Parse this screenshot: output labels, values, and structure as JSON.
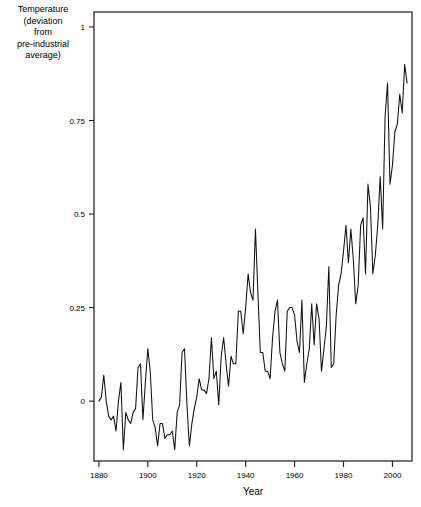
{
  "chart_data": {
    "type": "line",
    "title": "",
    "xlabel": "Year",
    "ylabel": "Temperature (deviation from pre-industrial average)",
    "ylabel_lines": [
      "Temperature",
      "(deviation",
      "from",
      "pre-industrial",
      "average)"
    ],
    "xlim": [
      1878,
      2008
    ],
    "ylim": [
      -0.16,
      1.04
    ],
    "grid": false,
    "legend": null,
    "xticks": [
      1880,
      1900,
      1920,
      1940,
      1960,
      1980,
      2000
    ],
    "xtick_labels": [
      "1880",
      "1900",
      "1920",
      "1940",
      "1960",
      "1980",
      "2000"
    ],
    "yticks": [
      0,
      0.25,
      0.5,
      0.75,
      1
    ],
    "ytick_labels": [
      "0",
      "0.25",
      "0.5",
      "0.75",
      "1"
    ],
    "line_color": "#111111",
    "series": [
      {
        "name": "Temperature anomaly",
        "x": [
          1880,
          1881,
          1882,
          1883,
          1884,
          1885,
          1886,
          1887,
          1888,
          1889,
          1890,
          1891,
          1892,
          1893,
          1894,
          1895,
          1896,
          1897,
          1898,
          1899,
          1900,
          1901,
          1902,
          1903,
          1904,
          1905,
          1906,
          1907,
          1908,
          1909,
          1910,
          1911,
          1912,
          1913,
          1914,
          1915,
          1916,
          1917,
          1918,
          1919,
          1920,
          1921,
          1922,
          1923,
          1924,
          1925,
          1926,
          1927,
          1928,
          1929,
          1930,
          1931,
          1932,
          1933,
          1934,
          1935,
          1936,
          1937,
          1938,
          1939,
          1940,
          1941,
          1942,
          1943,
          1944,
          1945,
          1946,
          1947,
          1948,
          1949,
          1950,
          1951,
          1952,
          1953,
          1954,
          1955,
          1956,
          1957,
          1958,
          1959,
          1960,
          1961,
          1962,
          1963,
          1964,
          1965,
          1966,
          1967,
          1968,
          1969,
          1970,
          1971,
          1972,
          1973,
          1974,
          1975,
          1976,
          1977,
          1978,
          1979,
          1980,
          1981,
          1982,
          1983,
          1984,
          1985,
          1986,
          1987,
          1988,
          1989,
          1990,
          1991,
          1992,
          1993,
          1994,
          1995,
          1996,
          1997,
          1998,
          1999,
          2000,
          2001,
          2002,
          2003,
          2004,
          2005,
          2006
        ],
        "values": [
          0.0,
          0.01,
          0.07,
          0.0,
          -0.04,
          -0.05,
          -0.04,
          -0.08,
          0.0,
          0.05,
          -0.13,
          -0.03,
          -0.05,
          -0.06,
          -0.03,
          -0.02,
          0.09,
          0.1,
          -0.05,
          0.05,
          0.14,
          0.08,
          -0.05,
          -0.07,
          -0.12,
          -0.06,
          -0.06,
          -0.1,
          -0.09,
          -0.09,
          -0.08,
          -0.13,
          -0.03,
          -0.01,
          0.13,
          0.14,
          -0.01,
          -0.12,
          -0.06,
          -0.02,
          0.01,
          0.06,
          0.03,
          0.03,
          0.02,
          0.06,
          0.17,
          0.06,
          0.08,
          -0.01,
          0.12,
          0.17,
          0.1,
          0.04,
          0.12,
          0.1,
          0.1,
          0.24,
          0.24,
          0.18,
          0.25,
          0.34,
          0.29,
          0.27,
          0.46,
          0.29,
          0.13,
          0.13,
          0.08,
          0.08,
          0.06,
          0.17,
          0.24,
          0.27,
          0.13,
          0.1,
          0.08,
          0.24,
          0.25,
          0.25,
          0.23,
          0.16,
          0.13,
          0.27,
          0.05,
          0.1,
          0.14,
          0.26,
          0.15,
          0.26,
          0.22,
          0.08,
          0.14,
          0.2,
          0.36,
          0.09,
          0.1,
          0.23,
          0.31,
          0.34,
          0.4,
          0.47,
          0.37,
          0.46,
          0.38,
          0.26,
          0.31,
          0.47,
          0.49,
          0.34,
          0.58,
          0.52,
          0.34,
          0.39,
          0.47,
          0.6,
          0.46,
          0.76,
          0.85,
          0.58,
          0.63,
          0.72,
          0.74,
          0.82,
          0.77,
          0.9,
          0.85
        ]
      }
    ]
  }
}
